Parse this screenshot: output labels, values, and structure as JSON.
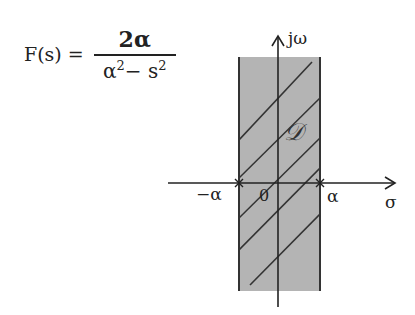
{
  "formula": {
    "lhs": "F(s) =",
    "numerator": "2α",
    "denominator_base1": "α",
    "denominator_exp1": "2",
    "denominator_op": "−",
    "denominator_base2": "s",
    "denominator_exp2": "2"
  },
  "axes": {
    "vertical_label": "jω",
    "horizontal_label": "σ",
    "origin_label": "0",
    "neg_tick_label": "−α",
    "pos_tick_label": "α"
  },
  "region": {
    "label": "𝒟",
    "fill_color": "#b4b4b4",
    "hatch_color": "#333333",
    "left_bound": "−α",
    "right_bound": "α"
  }
}
